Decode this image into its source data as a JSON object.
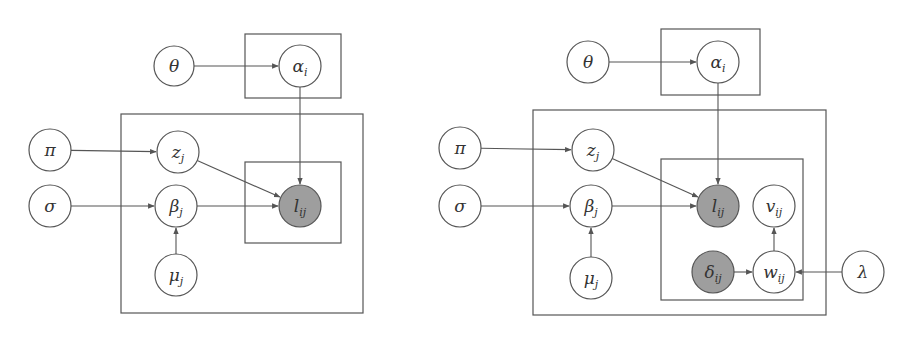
{
  "colors": {
    "observed_fill": "#9e9e9e",
    "latent_fill": "#ffffff",
    "stroke": "#555555",
    "text": "#333333"
  },
  "diagrams": [
    {
      "name": "left-model",
      "plates": [
        {
          "id": "plate-i-alpha",
          "x": 245,
          "y": 34,
          "w": 96,
          "h": 64
        },
        {
          "id": "plate-j",
          "x": 121,
          "y": 114,
          "w": 242,
          "h": 199
        },
        {
          "id": "plate-ij",
          "x": 245,
          "y": 162,
          "w": 96,
          "h": 81
        }
      ],
      "nodes": [
        {
          "id": "theta",
          "symbol": "θ",
          "sub": "",
          "cx": 174,
          "cy": 66,
          "r": 20,
          "observed": false
        },
        {
          "id": "alpha",
          "symbol": "α",
          "sub": "i",
          "cx": 300,
          "cy": 66,
          "r": 21,
          "observed": false
        },
        {
          "id": "pi",
          "symbol": "π",
          "sub": "",
          "cx": 50,
          "cy": 150,
          "r": 21,
          "observed": false
        },
        {
          "id": "z",
          "symbol": "z",
          "sub": "j",
          "cx": 178,
          "cy": 152,
          "r": 21,
          "observed": false
        },
        {
          "id": "sigma",
          "symbol": "σ",
          "sub": "",
          "cx": 50,
          "cy": 206,
          "r": 21,
          "observed": false
        },
        {
          "id": "beta",
          "symbol": "β",
          "sub": "j",
          "cx": 176,
          "cy": 206,
          "r": 21,
          "observed": false
        },
        {
          "id": "l",
          "symbol": "l",
          "sub": "ij",
          "cx": 300,
          "cy": 206,
          "r": 21,
          "observed": true
        },
        {
          "id": "mu",
          "symbol": "μ",
          "sub": "j",
          "cx": 176,
          "cy": 275,
          "r": 21,
          "observed": false
        }
      ],
      "edges": [
        {
          "from": "theta",
          "to": "alpha"
        },
        {
          "from": "alpha",
          "to": "l"
        },
        {
          "from": "pi",
          "to": "z"
        },
        {
          "from": "z",
          "to": "l"
        },
        {
          "from": "sigma",
          "to": "beta"
        },
        {
          "from": "beta",
          "to": "l"
        },
        {
          "from": "mu",
          "to": "beta"
        }
      ]
    },
    {
      "name": "right-model",
      "plates": [
        {
          "id": "plate-i-alpha",
          "x": 661,
          "y": 29,
          "w": 99,
          "h": 66
        },
        {
          "id": "plate-j",
          "x": 533,
          "y": 110,
          "w": 293,
          "h": 205
        },
        {
          "id": "plate-ij",
          "x": 661,
          "y": 159,
          "w": 142,
          "h": 141
        }
      ],
      "nodes": [
        {
          "id": "theta",
          "symbol": "θ",
          "sub": "",
          "cx": 588,
          "cy": 62,
          "r": 21,
          "observed": false
        },
        {
          "id": "alpha",
          "symbol": "α",
          "sub": "i",
          "cx": 718,
          "cy": 62,
          "r": 21,
          "observed": false
        },
        {
          "id": "pi",
          "symbol": "π",
          "sub": "",
          "cx": 460,
          "cy": 148,
          "r": 21,
          "observed": false
        },
        {
          "id": "z",
          "symbol": "z",
          "sub": "j",
          "cx": 593,
          "cy": 150,
          "r": 21,
          "observed": false
        },
        {
          "id": "sigma",
          "symbol": "σ",
          "sub": "",
          "cx": 460,
          "cy": 206,
          "r": 21,
          "observed": false
        },
        {
          "id": "beta",
          "symbol": "β",
          "sub": "j",
          "cx": 591,
          "cy": 206,
          "r": 21,
          "observed": false
        },
        {
          "id": "l",
          "symbol": "l",
          "sub": "ij",
          "cx": 718,
          "cy": 206,
          "r": 21,
          "observed": true
        },
        {
          "id": "v",
          "symbol": "v",
          "sub": "ij",
          "cx": 774,
          "cy": 206,
          "r": 21,
          "observed": false
        },
        {
          "id": "mu",
          "symbol": "μ",
          "sub": "j",
          "cx": 591,
          "cy": 278,
          "r": 21,
          "observed": false
        },
        {
          "id": "delta",
          "symbol": "δ",
          "sub": "ij",
          "cx": 713,
          "cy": 272,
          "r": 21,
          "observed": true
        },
        {
          "id": "w",
          "symbol": "w",
          "sub": "ij",
          "cx": 774,
          "cy": 272,
          "r": 21,
          "observed": false
        },
        {
          "id": "lambda",
          "symbol": "λ",
          "sub": "",
          "cx": 863,
          "cy": 272,
          "r": 21,
          "observed": false
        }
      ],
      "edges": [
        {
          "from": "theta",
          "to": "alpha"
        },
        {
          "from": "alpha",
          "to": "l"
        },
        {
          "from": "pi",
          "to": "z"
        },
        {
          "from": "z",
          "to": "l"
        },
        {
          "from": "sigma",
          "to": "beta"
        },
        {
          "from": "beta",
          "to": "l"
        },
        {
          "from": "mu",
          "to": "beta"
        },
        {
          "from": "delta",
          "to": "w"
        },
        {
          "from": "w",
          "to": "v"
        },
        {
          "from": "lambda",
          "to": "w"
        }
      ]
    }
  ]
}
